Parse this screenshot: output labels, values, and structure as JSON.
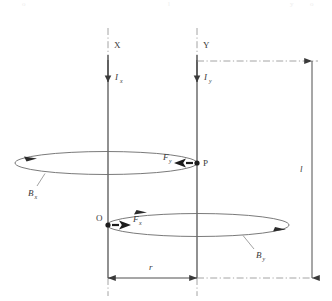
{
  "figure": {
    "type": "physics-diagram",
    "background_color": "#ffffff",
    "line_color": "#555555",
    "text_color": "#3a3a3a"
  },
  "conductors": [
    {
      "id": "x",
      "label": "X",
      "current_symbol": "I",
      "current_subscript": "x",
      "current_direction": "down",
      "x_position": 108
    },
    {
      "id": "y",
      "label": "Y",
      "current_symbol": "I",
      "current_subscript": "y",
      "current_direction": "down",
      "x_position": 197
    }
  ],
  "points": [
    {
      "id": "p",
      "label": "P",
      "on_conductor": "y",
      "x": 197,
      "y": 163
    },
    {
      "id": "o",
      "label": "O",
      "on_conductor": "x",
      "x": 108,
      "y": 225
    }
  ],
  "fields": [
    {
      "id": "bx",
      "symbol": "B",
      "subscript": "x",
      "source_conductor": "x",
      "description": "magnetic field loop around conductor X passing through P"
    },
    {
      "id": "by",
      "symbol": "B",
      "subscript": "y",
      "source_conductor": "y",
      "description": "magnetic field loop around conductor Y passing through O"
    }
  ],
  "forces": [
    {
      "id": "fy",
      "symbol": "F",
      "subscript": "y",
      "at_point": "P",
      "arrow_direction": "left",
      "description": "force on conductor Y at point P"
    },
    {
      "id": "fx",
      "symbol": "F",
      "subscript": "x",
      "at_point": "O",
      "arrow_direction": "right",
      "description": "force on conductor X at point O"
    }
  ],
  "dimensions": [
    {
      "id": "r",
      "label": "r",
      "orientation": "horizontal",
      "description": "separation between conductors X and Y",
      "arrow_style": "double-headed"
    },
    {
      "id": "l",
      "label": "l",
      "orientation": "vertical",
      "description": "length of conductor segment",
      "arrow_style": "double-headed"
    }
  ]
}
